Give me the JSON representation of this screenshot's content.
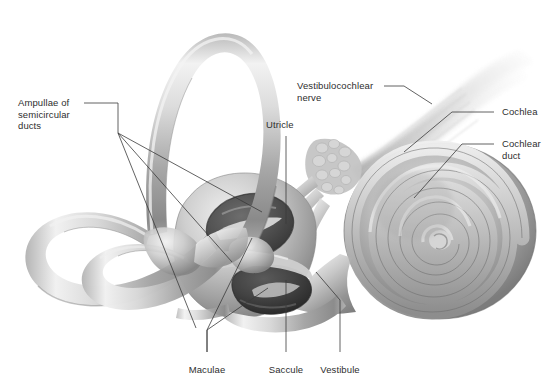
{
  "figure": {
    "style": "grayscale medical illustration",
    "background_color": "#ffffff",
    "label_color": "#2e2e2e",
    "leader_line_color": "#3a3a3a"
  },
  "labels": {
    "ampullae": "Ampullae of\nsemicircular\nducts",
    "utricle": "Utricle",
    "vestibulocochlear_nerve": "Vestibulocochlear\nnerve",
    "cochlea": "Cochlea",
    "cochlear_duct": "Cochlear\nduct",
    "maculae": "Maculae",
    "saccule": "Saccule",
    "vestibule": "Vestibule"
  },
  "structures": {
    "anterior_canal": "anterior-semicircular-canal",
    "posterior_canal": "posterior-semicircular-canal",
    "lateral_canal": "lateral-semicircular-canal",
    "utricle_cavity": "utricle-cavity",
    "saccule_cavity": "saccule-cavity",
    "cochlea_spiral": "cochlea-spiral",
    "nerve_trunk": "vestibulocochlear-nerve-trunk"
  }
}
